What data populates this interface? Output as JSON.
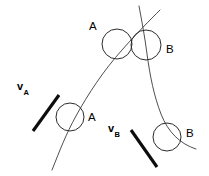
{
  "figure": {
    "background_color": "#ffffff",
    "width": 209,
    "height": 176,
    "stroke_color": "#3a3a3a",
    "circle_color": "#2b2b2b",
    "vector_color": "#0d0d0d"
  },
  "labels": {
    "particle_a_upper": "A",
    "particle_a_lower": "A",
    "particle_b_upper": "B",
    "particle_b_lower": "B"
  },
  "vectors": [
    {
      "id": "v-a",
      "symbol": "v",
      "subscript": "A",
      "direction": "up-right",
      "x1": 33,
      "y1": 131,
      "x2": 59,
      "y2": 95
    },
    {
      "id": "v-b",
      "symbol": "v",
      "subscript": "B",
      "direction": "down-right",
      "x1": 131,
      "y1": 130,
      "x2": 157,
      "y2": 167
    }
  ],
  "trajectories": [
    {
      "id": "path-a",
      "particle": "A",
      "description": "Trajectory of particle A rising from lower-left to upper-right",
      "d": "M 52 170 C 60 150 66 134 76 116 C 88 94 104 70 122 50 C 136 34 150 20 160 10"
    },
    {
      "id": "path-b",
      "particle": "B",
      "description": "Trajectory of particle B descending from upper-left down to lower-right",
      "d": "M 139 6 C 142 22 145 38 147 54 C 150 76 154 96 161 114 C 168 132 180 144 196 149"
    }
  ],
  "circles": [
    {
      "id": "circle-a-upper",
      "particle": "A",
      "cx": 117,
      "cy": 44,
      "r": 15
    },
    {
      "id": "circle-b-upper",
      "particle": "B",
      "cx": 146,
      "cy": 45,
      "r": 15
    },
    {
      "id": "circle-a-lower",
      "particle": "A",
      "cx": 70,
      "cy": 117,
      "r": 14
    },
    {
      "id": "circle-b-lower",
      "particle": "B",
      "cx": 167,
      "cy": 137,
      "r": 14
    }
  ]
}
